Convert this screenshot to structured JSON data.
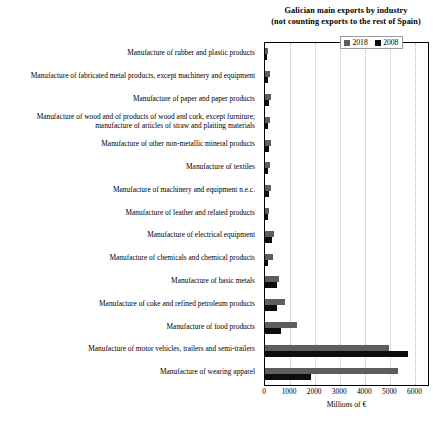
{
  "chart_data": {
    "type": "bar",
    "orientation": "horizontal",
    "title": "Galician main exports by industry",
    "subtitle": "(not counting exports to the rest of Spain)",
    "xlabel": "Millions of €",
    "ylabel": "",
    "xlim": [
      0,
      6500
    ],
    "xticks": [
      0,
      1000,
      2000,
      3000,
      4000,
      5000,
      6000
    ],
    "xticklabels": [
      "0",
      "1000",
      "2000",
      "3000",
      "4000",
      "5000",
      "6000"
    ],
    "grid": "vertical-dotted",
    "legend_position": "top-right",
    "categories": [
      "Manufacture of rubber and plastic products",
      "Manufacture of fabricated metal products, except machinery and equipment",
      "Manufacture of paper and paper products",
      "Manufacture of wood and of products of wood and cork, except furniture; manufacture of articles of straw and plaiting materials",
      "Manufacture of other non-metallic mineral products",
      "Manufacture of textiles",
      "Manufacture of machinery and equipment n.e.c.",
      "Manufacture of leather and related products",
      "Manufacture of electrical equipment",
      "Manufacture of chemicals and chemical products",
      "Manufacture of basic metals",
      "Manufacture of coke and refined petroleum products",
      "Manufacture of food products",
      "Manufacture of motor vehicles, trailers and semi-trailers",
      "Manufacture of wearing apparel"
    ],
    "series": [
      {
        "name": "2018",
        "color": "#5e5e5e",
        "values": [
          120,
          200,
          230,
          190,
          250,
          210,
          240,
          170,
          340,
          300,
          560,
          790,
          1290,
          4950,
          5300
        ]
      },
      {
        "name": "2008",
        "color": "#0d0d0d",
        "values": [
          70,
          120,
          160,
          120,
          150,
          130,
          150,
          110,
          290,
          110,
          470,
          480,
          640,
          5700,
          1850
        ]
      }
    ]
  },
  "legend": {
    "items": [
      {
        "label": "2018",
        "color": "#5e5e5e"
      },
      {
        "label": "2008",
        "color": "#0d0d0d"
      }
    ]
  }
}
